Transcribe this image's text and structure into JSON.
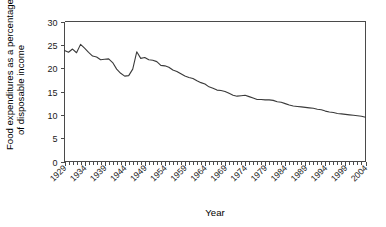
{
  "chart_data": {
    "type": "line",
    "title": "",
    "xlabel": "Year",
    "ylabel": "Food expenditures as a percentage of disposable income",
    "ylabel_line1": "Food expenditures as a percentage",
    "ylabel_line2": "of disposable income",
    "xlim": [
      1929,
      2004
    ],
    "ylim": [
      0,
      30
    ],
    "yticks": [
      0,
      5,
      10,
      15,
      20,
      25,
      30
    ],
    "ytick_labels": [
      "0",
      "5",
      "10",
      "15",
      "20",
      "25",
      "30"
    ],
    "xticks": [
      1929,
      1934,
      1939,
      1944,
      1949,
      1954,
      1959,
      1964,
      1969,
      1974,
      1979,
      1984,
      1989,
      1994,
      1999,
      2004
    ],
    "xtick_labels": [
      "1929",
      "1934",
      "1939",
      "1944",
      "1949",
      "1954",
      "1959",
      "1964",
      "1969",
      "1974",
      "1979",
      "1984",
      "1989",
      "1994",
      "1999",
      "2004"
    ],
    "minor_xtick_interval": 1,
    "grid": false,
    "legend": false,
    "line_color": "#3a3a3a",
    "axis_color": "#4a4a4a",
    "background_color": "#ffffff",
    "x": [
      1929,
      1930,
      1931,
      1932,
      1933,
      1934,
      1935,
      1936,
      1937,
      1938,
      1939,
      1940,
      1941,
      1942,
      1943,
      1944,
      1945,
      1946,
      1947,
      1948,
      1949,
      1950,
      1951,
      1952,
      1953,
      1954,
      1955,
      1956,
      1957,
      1958,
      1959,
      1960,
      1961,
      1962,
      1963,
      1964,
      1965,
      1966,
      1967,
      1968,
      1969,
      1970,
      1971,
      1972,
      1973,
      1974,
      1975,
      1976,
      1977,
      1978,
      1979,
      1980,
      1981,
      1982,
      1983,
      1984,
      1985,
      1986,
      1987,
      1988,
      1989,
      1990,
      1991,
      1992,
      1993,
      1994,
      1995,
      1996,
      1997,
      1998,
      1999,
      2000,
      2001,
      2002,
      2003,
      2004
    ],
    "y": [
      23.8,
      23.4,
      24.1,
      23.3,
      25.1,
      24.3,
      23.4,
      22.6,
      22.4,
      21.8,
      21.9,
      22.0,
      21.2,
      19.8,
      18.9,
      18.3,
      18.4,
      19.8,
      23.5,
      22.1,
      22.3,
      21.8,
      21.7,
      21.4,
      20.6,
      20.5,
      20.2,
      19.6,
      19.3,
      18.8,
      18.3,
      18.0,
      17.8,
      17.3,
      16.9,
      16.6,
      16.0,
      15.7,
      15.3,
      15.2,
      15.0,
      14.6,
      14.2,
      14.0,
      14.1,
      14.2,
      13.9,
      13.6,
      13.3,
      13.3,
      13.2,
      13.2,
      13.1,
      12.8,
      12.7,
      12.4,
      12.1,
      11.9,
      11.8,
      11.7,
      11.6,
      11.5,
      11.4,
      11.2,
      11.1,
      10.8,
      10.6,
      10.5,
      10.3,
      10.2,
      10.1,
      10.0,
      9.9,
      9.8,
      9.7,
      9.5
    ]
  }
}
